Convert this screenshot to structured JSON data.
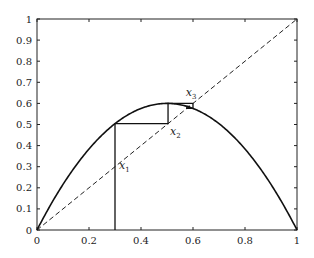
{
  "chart_data": {
    "type": "line",
    "title": "",
    "xlabel": "",
    "ylabel": "",
    "xlim": [
      0,
      1
    ],
    "ylim": [
      0,
      1
    ],
    "grid": false,
    "x_ticks": [
      "0",
      "0.2",
      "0.4",
      "0.6",
      "0.8",
      "1"
    ],
    "y_ticks": [
      "0",
      "0.1",
      "0.2",
      "0.3",
      "0.4",
      "0.5",
      "0.6",
      "0.7",
      "0.8",
      "0.9",
      "1"
    ],
    "series": [
      {
        "name": "f(x) = 2.4 x (1 - x)",
        "style": "solid",
        "r": 2.4
      },
      {
        "name": "y = x",
        "style": "dashed",
        "x": [
          0,
          1
        ],
        "y": [
          0,
          1
        ]
      },
      {
        "name": "cobweb",
        "style": "solid",
        "x0": 0.3
      }
    ],
    "annotations": [
      {
        "text": "x",
        "sub": "1",
        "x": 0.3,
        "y": 0.3
      },
      {
        "text": "x",
        "sub": "2",
        "x": 0.5,
        "y": 0.5
      },
      {
        "text": "x",
        "sub": "3",
        "x": 0.58,
        "y": 0.6
      }
    ]
  }
}
